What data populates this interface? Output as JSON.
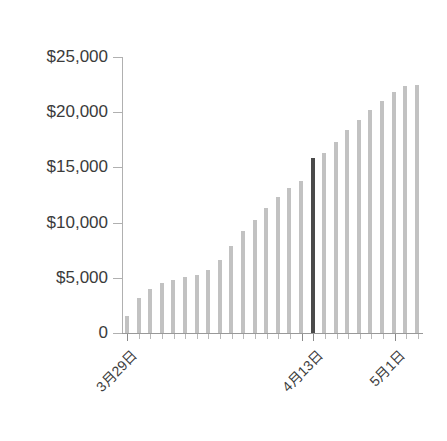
{
  "chart_data": {
    "type": "bar",
    "title": "",
    "subtitle": "",
    "xlabel": "",
    "ylabel": "",
    "ylim": [
      0,
      25000
    ],
    "grid": false,
    "legend": null,
    "y_ticks": [
      25000,
      20000,
      15000,
      10000,
      5000,
      0
    ],
    "y_tick_labels": [
      "$25,000",
      "$20,000",
      "$15,000",
      "$10,000",
      "$5,000",
      "0"
    ],
    "x_tick_labels": [
      "3月29日",
      "4月13日",
      "5月1日"
    ],
    "x_tick_indices": [
      0,
      15,
      23
    ],
    "categories": [
      "3月29日",
      "3月30日",
      "3月31日",
      "4月1日",
      "4月2日",
      "4月3日",
      "4月4日",
      "4月5日",
      "4月6日",
      "4月7日",
      "4月8日",
      "4月9日",
      "4月10日",
      "4月11日",
      "4月12日",
      "4月13日",
      "4月14日",
      "4月15日",
      "4月16日",
      "4月17日",
      "4月18日",
      "4月19日",
      "4月20日",
      "5月1日",
      "5月2日",
      "5月3日"
    ],
    "values": [
      1500,
      3200,
      4000,
      4500,
      4800,
      5100,
      5300,
      5700,
      6600,
      7900,
      9200,
      10200,
      11300,
      12300,
      13100,
      13800,
      15850,
      16300,
      17300,
      18400,
      19300,
      20200,
      21000,
      21800,
      22400,
      22500
    ],
    "highlight_index": 16,
    "colors": {
      "bar": "#c2c2c2",
      "bar_highlight": "#4a4a4a",
      "axis": "#999999",
      "tick": "#b0b0b0",
      "text": "#3b3b3b",
      "background": "#ffffff"
    }
  }
}
